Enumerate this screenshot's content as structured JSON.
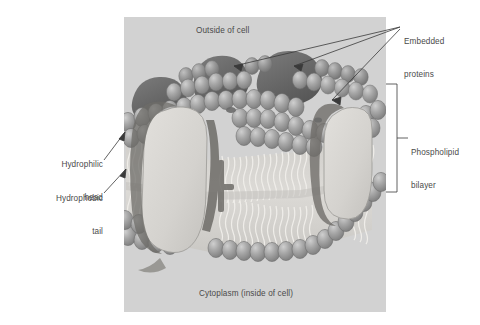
{
  "figure": {
    "panel": {
      "background_color": "#d2d2d2",
      "x": 124,
      "y": 17,
      "width": 262,
      "height": 295
    },
    "page_background_color": "#ffffff",
    "colors": {
      "panel_gray": "#d2d2d2",
      "lipid_head": "#9a9a9a",
      "lipid_head_highlight": "#c6c6c6",
      "lipid_tail": "#e6e4e0",
      "protein_dark": "#6b6b6b",
      "protein_light": "#d8d6d2",
      "label_text": "#4a4a4a",
      "leader_line": "#3a3a3a"
    }
  },
  "labels": {
    "outside_of_cell": "Outside of cell",
    "cytoplasm": "Cytoplasm (inside of cell)",
    "embedded_proteins_line1": "Embedded",
    "embedded_proteins_line2": "proteins",
    "phospholipid_bilayer_line1": "Phospholipid",
    "phospholipid_bilayer_line2": "bilayer",
    "hydrophilic_head_line1": "Hydrophilic",
    "hydrophilic_head_line2": "head",
    "hydrophobic_tail_line1": "Hydrophobic",
    "hydrophobic_tail_line2": "tail"
  },
  "annotations": {
    "embedded_proteins_arrow_count": 3,
    "hydrophilic_head_arrow_count": 1,
    "hydrophobic_tail_arrow_count": 1,
    "bilayer_bracket": {
      "x": 392,
      "top": 84,
      "bottom": 192
    }
  },
  "structures": [
    {
      "name": "outer-lipid-head-layer",
      "type": "phospholipid heads",
      "position": "upper"
    },
    {
      "name": "inner-lipid-head-layer",
      "type": "phospholipid heads",
      "position": "lower"
    },
    {
      "name": "hydrophobic-tail-core",
      "type": "fatty acid tails",
      "position": "middle"
    },
    {
      "name": "channel-protein-left",
      "type": "integral protein",
      "shade": "light"
    },
    {
      "name": "channel-protein-right",
      "type": "integral protein",
      "shade": "light"
    },
    {
      "name": "peripheral-protein-left",
      "type": "embedded protein",
      "shade": "dark"
    },
    {
      "name": "peripheral-protein-center",
      "type": "embedded protein",
      "shade": "dark"
    },
    {
      "name": "peripheral-protein-right",
      "type": "embedded protein",
      "shade": "dark"
    }
  ]
}
